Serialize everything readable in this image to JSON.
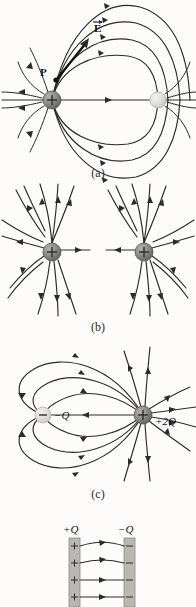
{
  "figure": {
    "panels": [
      {
        "id": "a",
        "caption": "(a)",
        "description": "electric dipole field lines",
        "labels": [
          {
            "name": "field-vector-label",
            "text": "E",
            "style": "bold-vector"
          },
          {
            "name": "point-p-label",
            "text": "P",
            "style": "bold"
          }
        ],
        "charges": [
          {
            "name": "positive-charge",
            "sign": "+",
            "x": 52,
            "y": 100,
            "r": 9,
            "shade": "dark"
          },
          {
            "name": "negative-charge",
            "sign": "",
            "x": 158,
            "y": 100,
            "r": 8,
            "shade": "light"
          }
        ]
      },
      {
        "id": "b",
        "caption": "(b)",
        "description": "two equal positive charges repelling field lines",
        "labels": [],
        "charges": [
          {
            "name": "positive-charge-left",
            "sign": "+",
            "x": 52,
            "y": 70,
            "r": 9,
            "shade": "dark"
          },
          {
            "name": "positive-charge-right",
            "sign": "+",
            "x": 144,
            "y": 70,
            "r": 9,
            "shade": "dark"
          }
        ]
      },
      {
        "id": "c",
        "caption": "(c)",
        "description": "unequal opposite charges minus Q and plus 2Q",
        "labels": [
          {
            "name": "charge-label-minus-q",
            "text": "−Q",
            "style": "italic"
          },
          {
            "name": "charge-label-plus-2q",
            "text": "+2Q",
            "style": "italic"
          }
        ],
        "charges": [
          {
            "name": "negative-charge",
            "sign": "−",
            "x": 43,
            "y": 70,
            "r": 8,
            "shade": "light"
          },
          {
            "name": "positive-charge",
            "sign": "+",
            "x": 143,
            "y": 70,
            "r": 9,
            "shade": "dark"
          }
        ]
      },
      {
        "id": "d",
        "caption": "",
        "description": "parallel charged plates with uniform field",
        "labels": [
          {
            "name": "plate-label-positive",
            "text": "+Q",
            "style": "italic"
          },
          {
            "name": "plate-label-negative",
            "text": "−Q",
            "style": "italic"
          }
        ],
        "plates": [
          {
            "name": "positive-plate",
            "charge_sign": "+",
            "signs": 4
          },
          {
            "name": "negative-plate",
            "charge_sign": "−",
            "signs": 4
          }
        ],
        "field_lines": 4
      }
    ],
    "colors": {
      "line": "#2a2a2a",
      "charge_dark": "#7e7c79",
      "charge_light": "#d8d6d1",
      "plate": "#b9b7b2",
      "background": "#fdfcfa"
    }
  }
}
